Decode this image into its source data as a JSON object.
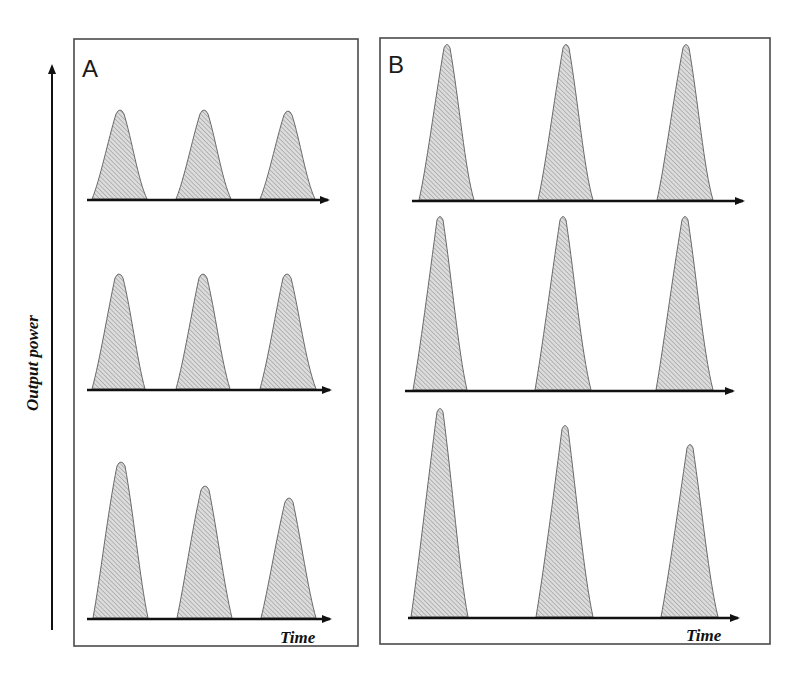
{
  "figure": {
    "y_axis_label": "Output power",
    "x_axis_label": "Time",
    "panels": [
      {
        "label": "A",
        "rows": [
          {
            "description": "equal amplitude pulses",
            "peak_heights_px": [
              89,
              89,
              88
            ]
          },
          {
            "description": "equal amplitude pulses",
            "peak_heights_px": [
              118,
              118,
              118
            ]
          },
          {
            "description": "decaying amplitude pulses",
            "peak_heights_px": [
              158,
              135,
              123
            ]
          }
        ]
      },
      {
        "label": "B",
        "rows": [
          {
            "description": "equal amplitude narrow pulses",
            "peak_heights_px": [
              158,
              158,
              158
            ]
          },
          {
            "description": "equal amplitude narrow pulses",
            "peak_heights_px": [
              176,
              176,
              176
            ]
          },
          {
            "description": "decaying amplitude narrow pulses",
            "peak_heights_px": [
              211,
              194,
              175
            ]
          }
        ]
      }
    ],
    "colors": {
      "frame": "#4a4a4a",
      "axis": "#111111",
      "pulse_fill": "#dcdcdc",
      "pulse_hatch": "#8c8c8c"
    }
  }
}
